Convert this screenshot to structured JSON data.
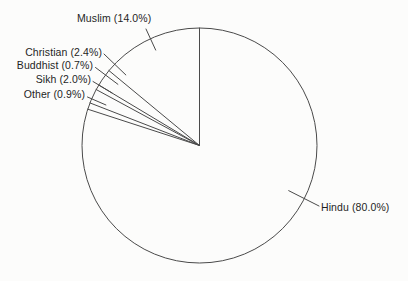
{
  "chart_data": {
    "type": "pie",
    "title": "",
    "categories": [
      "Muslim",
      "Christian",
      "Buddhist",
      "Sikh",
      "Other",
      "Hindu"
    ],
    "values": [
      14.0,
      2.4,
      0.7,
      2.0,
      0.9,
      80.0
    ],
    "unit": "%",
    "slices": [
      {
        "label": "Muslim",
        "value": 14.0,
        "display": "Muslim (14.0%)"
      },
      {
        "label": "Christian",
        "value": 2.4,
        "display": "Christian (2.4%)"
      },
      {
        "label": "Buddhist",
        "value": 0.7,
        "display": "Buddhist (0.7%)"
      },
      {
        "label": "Sikh",
        "value": 2.0,
        "display": "Sikh (2.0%)"
      },
      {
        "label": "Other",
        "value": 0.9,
        "display": "Other (0.9%)"
      },
      {
        "label": "Hindu",
        "value": 80.0,
        "display": "Hindu (80.0%)"
      }
    ],
    "layout_hints": {
      "start_angle_deg": 90,
      "direction": "counterclockwise",
      "fill": "none",
      "outline_only": true,
      "legend": "none",
      "labels": "external-with-leader-lines"
    },
    "colors": {
      "stroke": "#4a4a4a",
      "text": "#1f1f1f",
      "background": "#fcfcfb"
    }
  }
}
